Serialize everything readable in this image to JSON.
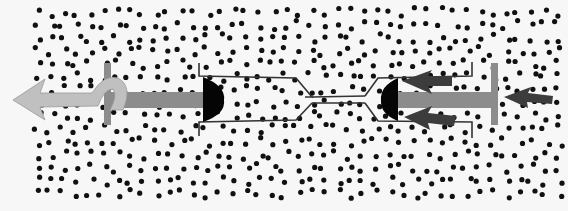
{
  "diagram": {
    "title": "",
    "colors": {
      "background": "#f7f7f7",
      "particle": "#111111",
      "barrel_outline": "#333333",
      "plunger_rod": "#8c8c8c",
      "plunger_rubber": "#050505",
      "pull_arrow": "#c0c0c0",
      "push_arrow": "#3c3c3c"
    },
    "particle_field": {
      "x0": 38,
      "x1": 558,
      "y0": 12,
      "y1": 200,
      "radius": 2.6
    },
    "components": [
      {
        "id": "left-syringe",
        "label": ""
      },
      {
        "id": "connecting-tube",
        "label": ""
      },
      {
        "id": "right-syringe",
        "label": ""
      },
      {
        "id": "pull-arrow",
        "direction": "left",
        "label": ""
      },
      {
        "id": "push-arrows",
        "direction": "left",
        "count": 3,
        "label": ""
      }
    ]
  }
}
